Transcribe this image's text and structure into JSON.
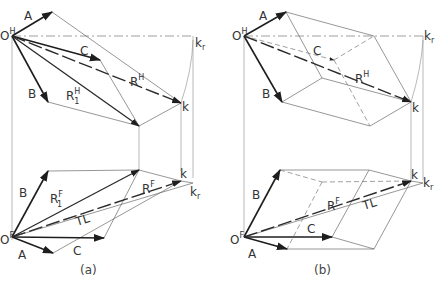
{
  "figure": {
    "panels": [
      {
        "caption": "(a)",
        "top_view": {
          "origin": "O",
          "origin_sup": "H",
          "vectors": [
            "A",
            "B",
            "C"
          ],
          "resultant": "R",
          "resultant_sup": "H",
          "partial_resultant": "R",
          "partial_resultant_sub": "1",
          "partial_resultant_sup": "H",
          "end_point": "k",
          "rotated_point": "k",
          "rotated_point_sub": "r"
        },
        "front_view": {
          "origin": "O",
          "origin_sup": "F",
          "vectors": [
            "A",
            "B",
            "C"
          ],
          "resultant": "R",
          "resultant_sup": "F",
          "partial_resultant": "R",
          "partial_resultant_sub": "1",
          "partial_resultant_sup": "F",
          "true_length": "TL",
          "end_point": "k",
          "rotated_point": "k",
          "rotated_point_sub": "r"
        }
      },
      {
        "caption": "(b)",
        "top_view": {
          "origin": "O",
          "origin_sup": "H",
          "vectors": [
            "A",
            "B",
            "C"
          ],
          "resultant": "R",
          "resultant_sup": "H",
          "end_point": "k",
          "rotated_point": "k",
          "rotated_point_sub": "r"
        },
        "front_view": {
          "origin": "O",
          "origin_sup": "F",
          "vectors": [
            "A",
            "B",
            "C"
          ],
          "resultant": "R",
          "resultant_sup": "F",
          "true_length": "TL",
          "end_point": "k",
          "rotated_point": "k",
          "rotated_point_sub": "r"
        }
      }
    ]
  }
}
